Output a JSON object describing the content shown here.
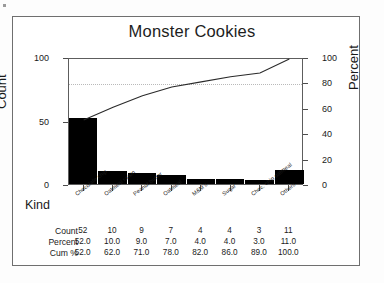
{
  "chart_data": {
    "type": "bar",
    "title": "Monster Cookies",
    "xlabel": "Kind",
    "ylabel": "Count",
    "ylabel_secondary": "Percent",
    "categories": [
      "Chocolate chip",
      "Oatmeal raisin",
      "Peanut butter",
      "Oatmeal",
      "M&M's",
      "Sugar",
      "Choc. chip oatmeal",
      "Others"
    ],
    "values": [
      52,
      10,
      9,
      7,
      4,
      4,
      3,
      11
    ],
    "percent": [
      52.0,
      10.0,
      9.0,
      7.0,
      4.0,
      4.0,
      3.0,
      11.0
    ],
    "cum_percent": [
      52.0,
      62.0,
      71.0,
      78.0,
      82.0,
      86.0,
      89.0,
      100.0
    ],
    "ylim": [
      0,
      100
    ],
    "ylim_secondary": [
      0,
      100
    ],
    "yticks": [
      0,
      50,
      100
    ],
    "yticks_secondary": [
      0,
      20,
      40,
      60,
      80,
      100
    ],
    "reference_line_percent": 80,
    "grid": false,
    "legend": "none",
    "series": [
      {
        "name": "Count",
        "type": "bar",
        "values": [
          52,
          10,
          9,
          7,
          4,
          4,
          3,
          11
        ]
      },
      {
        "name": "Cum %",
        "type": "line",
        "values": [
          52.0,
          62.0,
          71.0,
          78.0,
          82.0,
          86.0,
          89.0,
          100.0
        ]
      }
    ],
    "table": {
      "row_labels": [
        "Count",
        "Percent",
        "Cum %"
      ],
      "rows": [
        [
          "52",
          "10",
          "9",
          "7",
          "4",
          "4",
          "3",
          "11"
        ],
        [
          "52.0",
          "10.0",
          "9.0",
          "7.0",
          "4.0",
          "4.0",
          "3.0",
          "11.0"
        ],
        [
          "52.0",
          "62.0",
          "71.0",
          "78.0",
          "82.0",
          "86.0",
          "89.0",
          "100.0"
        ]
      ]
    }
  }
}
